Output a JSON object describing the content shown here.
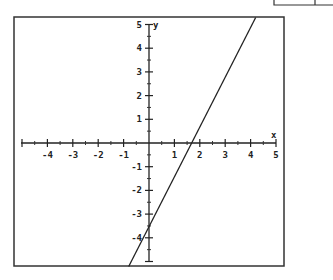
{
  "chart_data": {
    "type": "line",
    "title": "",
    "xlabel": "x",
    "ylabel": "y",
    "xlim": [
      -5,
      5
    ],
    "ylim": [
      -5,
      5
    ],
    "x_ticks": [
      -4,
      -3,
      -2,
      -1,
      1,
      2,
      3,
      4,
      5
    ],
    "y_ticks": [
      5,
      4,
      3,
      2,
      1,
      -1,
      -2,
      -3,
      -4
    ],
    "minor_tick_step": 0.5,
    "grid": false,
    "legend": null,
    "series": [
      {
        "name": "line",
        "equation": "y = 2x - 3.4",
        "slope": 2,
        "intercept": -3.4,
        "x": [
          -0.8,
          4.2
        ],
        "y": [
          -5,
          5
        ]
      }
    ],
    "annotations": {
      "x_intercept": 1.7,
      "y_intercept": -3.4
    }
  },
  "labels": {
    "x_axis": "x",
    "y_axis": "y",
    "x_ticks": [
      "-4",
      "-3",
      "-2",
      "-1",
      "1",
      "2",
      "3",
      "4",
      "5"
    ],
    "y_ticks": [
      "5",
      "4",
      "3",
      "2",
      "1",
      "-1",
      "-2",
      "-3",
      "-4"
    ]
  }
}
